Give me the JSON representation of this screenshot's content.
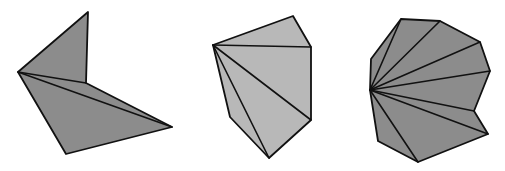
{
  "diagram": {
    "polygons": [
      {
        "name": "polygon-left",
        "fill": "#8c8c8c",
        "apex_index": 0,
        "vertex_count": 5
      },
      {
        "name": "polygon-middle",
        "fill": "#b8b8b8",
        "apex_index": 0,
        "vertex_count": 6
      },
      {
        "name": "polygon-right",
        "fill": "#8c8c8c",
        "apex_index": 0,
        "vertex_count": 11
      }
    ],
    "stroke_color": "#111111",
    "background": "#ffffff"
  }
}
